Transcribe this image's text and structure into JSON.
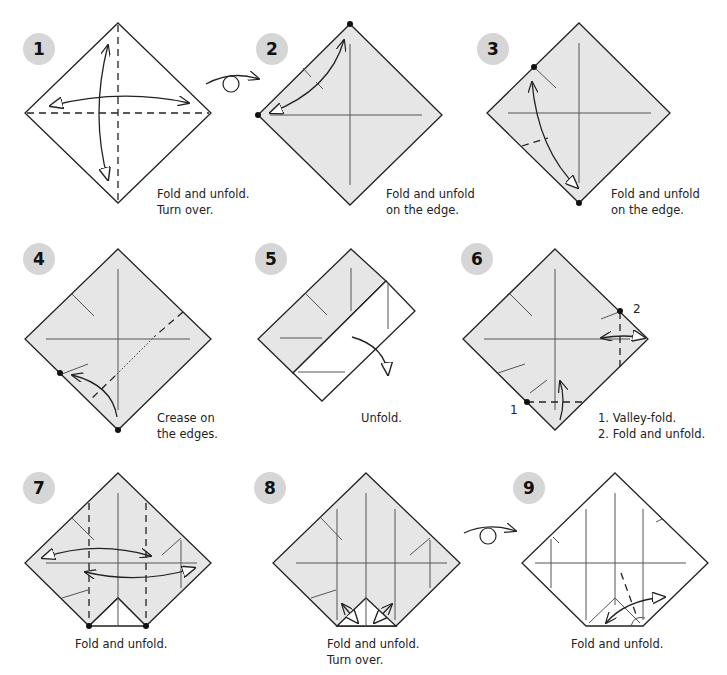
{
  "diagram": {
    "colors": {
      "paper_colored": "#e6e6e6",
      "paper_white": "#ffffff",
      "line": "#222222",
      "badge": "#d6d6d6"
    },
    "steps": [
      {
        "number": "1",
        "caption": "Fold and unfold.\nTurn over.",
        "symbols": [
          "valley-fold-diagonal",
          "valley-fold-horizontal",
          "fold-unfold-arrow",
          "fold-unfold-arrow"
        ]
      },
      {
        "number": "2",
        "caption": "Fold and unfold\non the edge.",
        "symbols": [
          "fold-unfold-arrow",
          "reference-dots"
        ]
      },
      {
        "number": "3",
        "caption": "Fold and unfold\non the edge.",
        "symbols": [
          "fold-unfold-arrow",
          "reference-dots",
          "valley-fold-short"
        ]
      },
      {
        "number": "4",
        "caption": "Crease on\nthe edges.",
        "symbols": [
          "fold-arrow",
          "reference-dots",
          "x-ray-line",
          "valley-fold-short"
        ]
      },
      {
        "number": "5",
        "caption": "Unfold.",
        "symbols": [
          "unfold-arrow"
        ]
      },
      {
        "number": "6",
        "caption": "1. Valley-fold.\n2. Fold and unfold.",
        "labels": [
          "1",
          "2"
        ],
        "symbols": [
          "valley-fold",
          "fold-unfold-arrow",
          "reference-dots"
        ]
      },
      {
        "number": "7",
        "caption": "Fold and unfold.",
        "symbols": [
          "valley-fold-vertical",
          "fold-unfold-arrow",
          "fold-unfold-arrow",
          "reference-dots"
        ]
      },
      {
        "number": "8",
        "caption": "Fold and unfold.\nTurn over.",
        "symbols": [
          "fold-unfold-arrow",
          "fold-unfold-arrow"
        ]
      },
      {
        "number": "9",
        "caption": "Fold and unfold.",
        "symbols": [
          "valley-fold",
          "fold-unfold-arrow"
        ]
      }
    ],
    "turn_over_symbols": [
      {
        "between": "1-2",
        "icon": "turn-over-icon"
      },
      {
        "between": "8-9",
        "icon": "turn-over-icon"
      }
    ]
  }
}
